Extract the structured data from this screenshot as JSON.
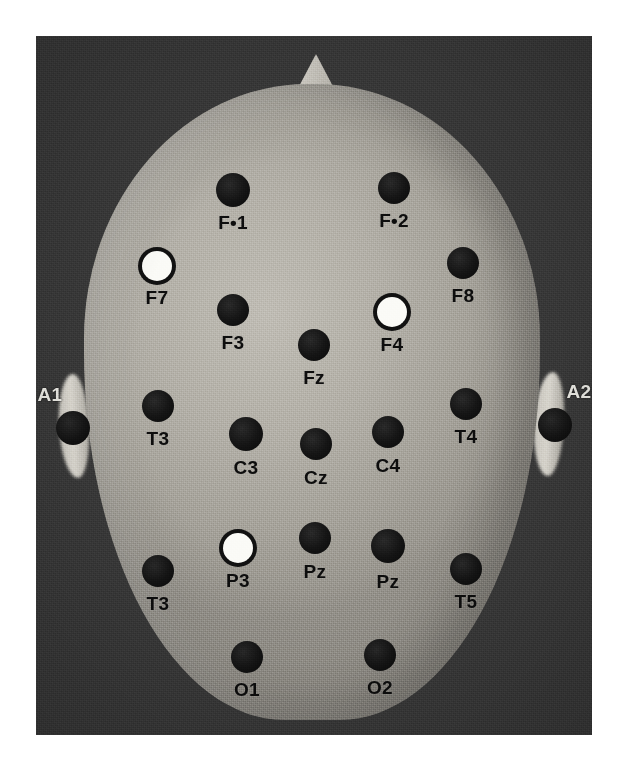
{
  "figure": {
    "kind": "photograph-diagram",
    "orientation_note": "nose at top, ears at left and right",
    "canvas": {
      "width": 619,
      "height": 762
    },
    "photo_frame": {
      "x": 36,
      "y": 36,
      "width": 556,
      "height": 699
    }
  },
  "colors": {
    "page_background": "#ffffff",
    "photo_background": "#3b3b3b",
    "scalp": "#b3b0a8",
    "electrode_filled": "#111111",
    "electrode_hollow_fill": "#fbfbf7",
    "electrode_hollow_ring": "#111111",
    "label_dark": "#0d0d0d",
    "label_light": "#f0efe9",
    "ear": "#d8d5cd",
    "nose": "#cfccc4"
  },
  "legend": {
    "filled_meaning": "filled black electrode",
    "hollow_meaning": "hollow white electrode"
  },
  "electrodes": [
    {
      "label": "F•1",
      "x": 233,
      "y": 190,
      "r": 17,
      "fill": "filled",
      "label_x": 233,
      "label_y": 213,
      "label_on_background": false
    },
    {
      "label": "F•2",
      "x": 394,
      "y": 188,
      "r": 16,
      "fill": "filled",
      "label_x": 394,
      "label_y": 211,
      "label_on_background": false
    },
    {
      "label": "F7",
      "x": 157,
      "y": 266,
      "r": 15,
      "fill": "hollow",
      "label_x": 157,
      "label_y": 288,
      "label_on_background": false
    },
    {
      "label": "F8",
      "x": 463,
      "y": 263,
      "r": 16,
      "fill": "filled",
      "label_x": 463,
      "label_y": 286,
      "label_on_background": false
    },
    {
      "label": "F3",
      "x": 233,
      "y": 310,
      "r": 16,
      "fill": "filled",
      "label_x": 233,
      "label_y": 333,
      "label_on_background": false
    },
    {
      "label": "F4",
      "x": 392,
      "y": 312,
      "r": 15,
      "fill": "hollow",
      "label_x": 392,
      "label_y": 335,
      "label_on_background": false
    },
    {
      "label": "Fz",
      "x": 314,
      "y": 345,
      "r": 16,
      "fill": "filled",
      "label_x": 314,
      "label_y": 368,
      "label_on_background": false
    },
    {
      "label": "A1",
      "x": 73,
      "y": 428,
      "r": 17,
      "fill": "filled",
      "label_x": 50,
      "label_y": 385,
      "label_on_background": true
    },
    {
      "label": "A2",
      "x": 555,
      "y": 425,
      "r": 17,
      "fill": "filled",
      "label_x": 579,
      "label_y": 382,
      "label_on_background": true
    },
    {
      "label": "T3",
      "x": 158,
      "y": 406,
      "r": 16,
      "fill": "filled",
      "label_x": 158,
      "label_y": 429,
      "label_on_background": false
    },
    {
      "label": "T4",
      "x": 466,
      "y": 404,
      "r": 16,
      "fill": "filled",
      "label_x": 466,
      "label_y": 427,
      "label_on_background": false
    },
    {
      "label": "C3",
      "x": 246,
      "y": 434,
      "r": 17,
      "fill": "filled",
      "label_x": 246,
      "label_y": 458,
      "label_on_background": false
    },
    {
      "label": "C4",
      "x": 388,
      "y": 432,
      "r": 16,
      "fill": "filled",
      "label_x": 388,
      "label_y": 456,
      "label_on_background": false
    },
    {
      "label": "Cz",
      "x": 316,
      "y": 444,
      "r": 16,
      "fill": "filled",
      "label_x": 316,
      "label_y": 468,
      "label_on_background": false
    },
    {
      "label": "T3",
      "x": 158,
      "y": 571,
      "r": 16,
      "fill": "filled",
      "label_x": 158,
      "label_y": 594,
      "label_on_background": false
    },
    {
      "label": "T5",
      "x": 466,
      "y": 569,
      "r": 16,
      "fill": "filled",
      "label_x": 466,
      "label_y": 592,
      "label_on_background": false
    },
    {
      "label": "P3",
      "x": 238,
      "y": 548,
      "r": 15,
      "fill": "hollow",
      "label_x": 238,
      "label_y": 571,
      "label_on_background": false
    },
    {
      "label": "Pz",
      "x": 315,
      "y": 538,
      "r": 16,
      "fill": "filled",
      "label_x": 315,
      "label_y": 562,
      "label_on_background": false
    },
    {
      "label": "Pz",
      "x": 388,
      "y": 546,
      "r": 17,
      "fill": "filled",
      "label_x": 388,
      "label_y": 572,
      "label_on_background": false
    },
    {
      "label": "O1",
      "x": 247,
      "y": 657,
      "r": 16,
      "fill": "filled",
      "label_x": 247,
      "label_y": 680,
      "label_on_background": false
    },
    {
      "label": "O2",
      "x": 380,
      "y": 655,
      "r": 16,
      "fill": "filled",
      "label_x": 380,
      "label_y": 678,
      "label_on_background": false
    }
  ]
}
